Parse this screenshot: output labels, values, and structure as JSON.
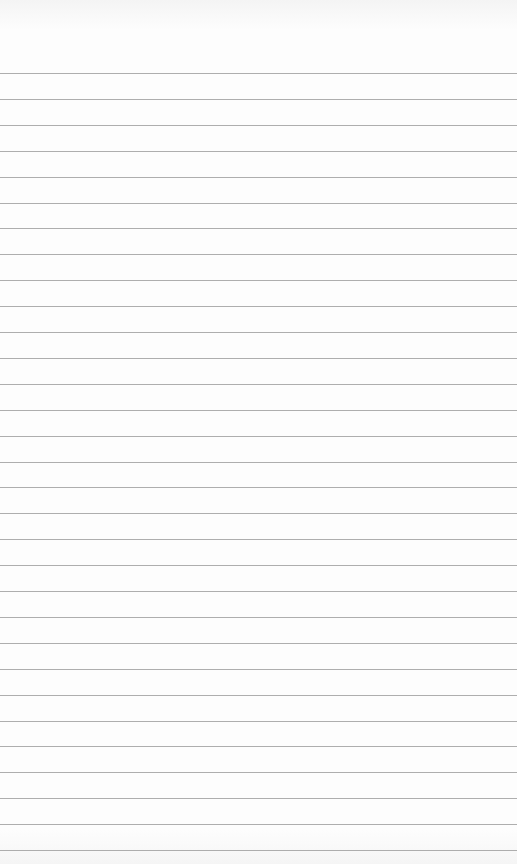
{
  "page": {
    "type": "blank lined paper",
    "background_color": "#fdfdfd",
    "line_color": "#9a9a9a",
    "line_count": 31,
    "first_line_y": 73,
    "line_spacing": 25.9
  }
}
